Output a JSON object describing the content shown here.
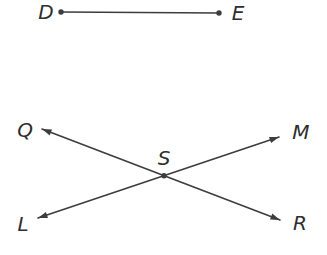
{
  "figure": {
    "width": 327,
    "height": 255,
    "background": "#ffffff",
    "stroke_color": "#3d3d3d",
    "stroke_width": 1.6,
    "dot_radius": 2.7,
    "arrow_length": 10,
    "arrow_half_angle_rad": 0.33,
    "label_color": "#2e2e2e",
    "label_font_size": 20,
    "strokes": [
      {
        "name": "segment-DE",
        "x1": 61,
        "y1": 12,
        "x2": 219,
        "y2": 13,
        "start_dot": true,
        "end_dot": true,
        "start_arrow": false,
        "end_arrow": false
      },
      {
        "name": "line-QR",
        "x1": 42,
        "y1": 129,
        "x2": 280,
        "y2": 220,
        "start_dot": false,
        "end_dot": false,
        "start_arrow": true,
        "end_arrow": true
      },
      {
        "name": "line-LM",
        "x1": 38,
        "y1": 218,
        "x2": 279,
        "y2": 137,
        "start_dot": false,
        "end_dot": false,
        "start_arrow": true,
        "end_arrow": true
      }
    ],
    "points": [
      {
        "name": "point-S",
        "x": 164,
        "y": 175.7
      }
    ],
    "labels": [
      {
        "name": "label-D",
        "text": "D",
        "x": 46,
        "y": 19
      },
      {
        "name": "label-E",
        "text": "E",
        "x": 238,
        "y": 20
      },
      {
        "name": "label-Q",
        "text": "Q",
        "x": 25,
        "y": 137
      },
      {
        "name": "label-M",
        "text": "M",
        "x": 301,
        "y": 139
      },
      {
        "name": "label-S",
        "text": "S",
        "x": 164,
        "y": 165
      },
      {
        "name": "label-L",
        "text": "L",
        "x": 23,
        "y": 231
      },
      {
        "name": "label-R",
        "text": "R",
        "x": 300,
        "y": 230
      }
    ]
  }
}
